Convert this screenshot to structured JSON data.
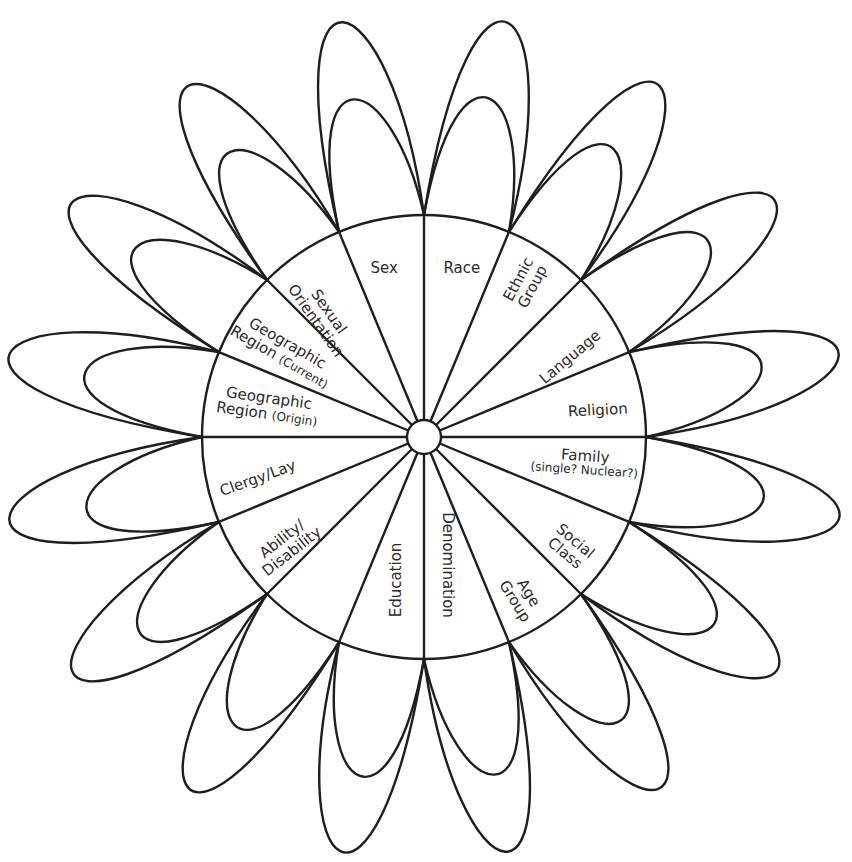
{
  "diagram": {
    "title": "",
    "center": {
      "x": 424,
      "y": 437
    },
    "circle_radius": 222,
    "hub_radius": 17,
    "stroke_color": "#1e1e1e",
    "text_color": "#2a2a2a",
    "background": "#ffffff",
    "sector_count": 16,
    "sector_angle_deg": 22.5,
    "petal_style": "two nested looping petals per sector, leaning counter-clockwise",
    "sectors": [
      {
        "id": "race",
        "label": "Race",
        "sub": "",
        "x": 462,
        "y": 268,
        "rot": 0
      },
      {
        "id": "ethnic-group",
        "label": "Ethnic",
        "label2": "Group",
        "sub": "",
        "x": 525,
        "y": 283,
        "rot": -62
      },
      {
        "id": "language",
        "label": "Language",
        "sub": "",
        "x": 570,
        "y": 357,
        "rot": -40
      },
      {
        "id": "religion",
        "label": "Religion",
        "sub": "",
        "x": 598,
        "y": 410,
        "rot": -3
      },
      {
        "id": "family",
        "label": "Family",
        "sub": "(single? Nuclear?)",
        "x": 585,
        "y": 462,
        "rot": 4
      },
      {
        "id": "social-class",
        "label": "Social",
        "label2": "Class",
        "sub": "",
        "x": 570,
        "y": 547,
        "rot": 40
      },
      {
        "id": "age-group",
        "label": "Age",
        "label2": "Group",
        "sub": "",
        "x": 522,
        "y": 597,
        "rot": 58
      },
      {
        "id": "denomination",
        "label": "Denomination",
        "sub": "",
        "x": 448,
        "y": 565,
        "rot": 90
      },
      {
        "id": "education",
        "label": "Education",
        "sub": "",
        "x": 396,
        "y": 580,
        "rot": -90
      },
      {
        "id": "blank",
        "label": "",
        "sub": "",
        "x": 0,
        "y": 0,
        "rot": 0
      },
      {
        "id": "ability-disability",
        "label": "Ability/",
        "label2": "Disability",
        "sub": "",
        "x": 287,
        "y": 545,
        "rot": -38
      },
      {
        "id": "clergy-lay",
        "label": "Clergy/Lay",
        "sub": "",
        "x": 258,
        "y": 478,
        "rot": -20
      },
      {
        "id": "geographic-region-origin",
        "label": "Geographic",
        "label2": "Region",
        "sub": "(Origin)",
        "x": 268,
        "y": 406,
        "rot": 8
      },
      {
        "id": "geographic-region-current",
        "label": "Geographic",
        "label2": "Region",
        "sub": "(Current)",
        "x": 283,
        "y": 350,
        "rot": 30
      },
      {
        "id": "sexual-orientation",
        "label": "Sexual",
        "label2": "Orientation",
        "sub": "",
        "x": 322,
        "y": 316,
        "rot": 55
      },
      {
        "id": "sex",
        "label": "Sex",
        "sub": "",
        "x": 384,
        "y": 268,
        "rot": 0
      }
    ]
  }
}
